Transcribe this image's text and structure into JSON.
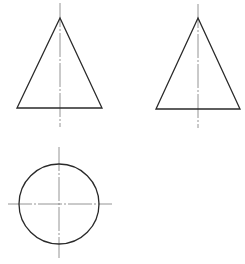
{
  "drawing": {
    "type": "orthographic-projection",
    "subject": "cone",
    "colors": {
      "background": "#ffffff",
      "outline": "#2a2a2a",
      "centerline": "#7a7a7a"
    },
    "views": [
      {
        "name": "front-view",
        "shape": "triangle",
        "apex": [
          60,
          18
        ],
        "base_left": [
          17,
          108
        ],
        "base_right": [
          102,
          108
        ],
        "centerline": {
          "x": 60,
          "y1": 3,
          "y2": 127
        }
      },
      {
        "name": "side-view",
        "shape": "triangle",
        "apex": [
          198,
          18
        ],
        "base_left": [
          156,
          109
        ],
        "base_right": [
          240,
          109
        ],
        "centerline": {
          "x": 198,
          "y1": 4,
          "y2": 128
        }
      },
      {
        "name": "top-view",
        "shape": "circle",
        "center": [
          59,
          204
        ],
        "radius": 40,
        "centerline_h": {
          "y": 204,
          "x1": 8,
          "x2": 112
        },
        "centerline_v": {
          "x": 59,
          "y1": 147,
          "y2": 258
        }
      }
    ]
  }
}
